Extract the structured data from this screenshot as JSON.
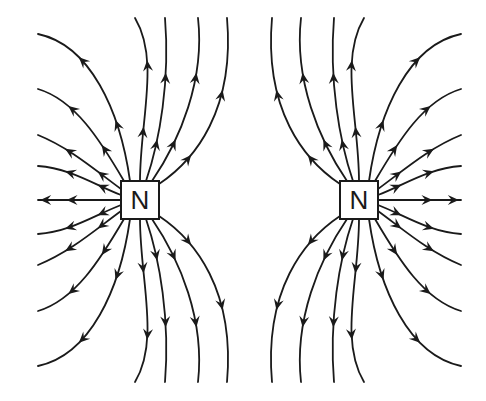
{
  "diagram": {
    "line_color": "#1a1a1a",
    "background": "#ffffff",
    "magnets": [
      {
        "id": "left",
        "label": "N",
        "cx": 140,
        "cy": 200,
        "size": 38
      },
      {
        "id": "right",
        "label": "N",
        "cx": 359,
        "cy": 200,
        "size": 38
      }
    ],
    "arrow_direction": "away-from-poles"
  }
}
